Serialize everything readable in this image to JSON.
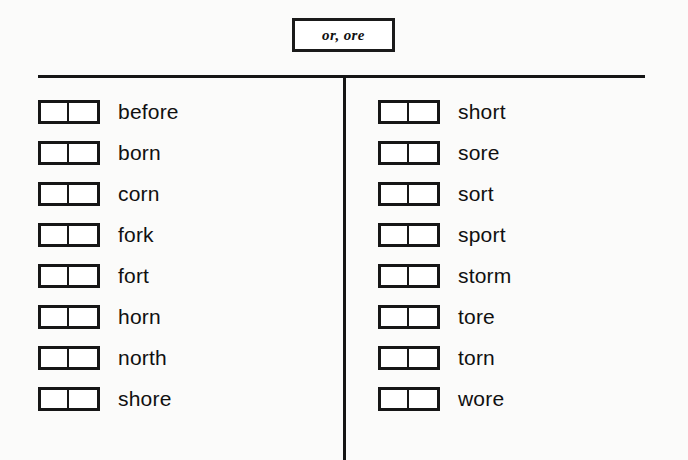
{
  "worksheet": {
    "title": "or, ore",
    "columns": [
      {
        "name": "left-column",
        "words": [
          "before",
          "born",
          "corn",
          "fork",
          "fort",
          "horn",
          "north",
          "shore"
        ]
      },
      {
        "name": "right-column",
        "words": [
          "short",
          "sore",
          "sort",
          "sport",
          "storm",
          "tore",
          "torn",
          "wore"
        ]
      }
    ],
    "colors": {
      "ink": "#151515",
      "background": "#fbfbfa",
      "box_fill": "#ffffff"
    }
  }
}
